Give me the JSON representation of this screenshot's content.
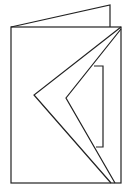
{
  "diagram": {
    "title": "",
    "stroke_color": "#222222",
    "background": "#ffffff"
  }
}
